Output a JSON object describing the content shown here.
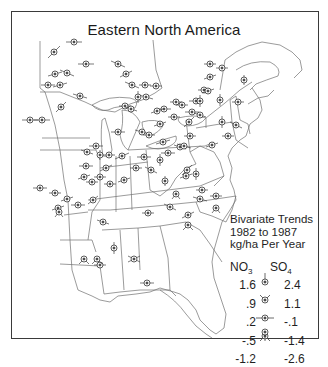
{
  "title": "Eastern North America",
  "legend": {
    "title_lines": [
      "Bivariate Trends",
      "1982 to 1987",
      "kg/ha Per Year"
    ],
    "col_left": "NO",
    "col_left_sub": "3",
    "col_right": "SO",
    "col_right_sub": "4",
    "rows": [
      {
        "no3": "1.6",
        "so4": "2.4",
        "glyph": "needle-up"
      },
      {
        "no3": ".9",
        "so4": "1.1",
        "glyph": "needle-v-up"
      },
      {
        "no3": ".2",
        "so4": "-.1",
        "glyph": "needle-horizontal"
      },
      {
        "no3": "-.5",
        "so4": "-1.4",
        "glyph": "needle-v-down"
      },
      {
        "no3": "-1.2",
        "so4": "-2.6",
        "glyph": "needle-down"
      }
    ]
  },
  "caption": "",
  "colors": {
    "ink": "#1f1f1f",
    "border": "#3a3a3a",
    "boundary": "#6f6f6f"
  }
}
